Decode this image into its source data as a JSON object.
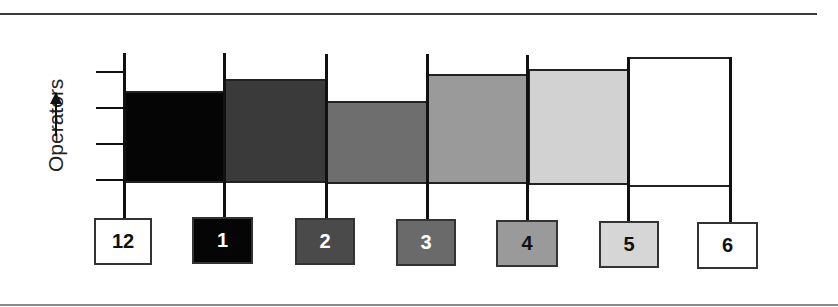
{
  "diagram": {
    "y_axis_label": "Operators",
    "y_axis_arrow": "arrow-up",
    "y_ticks": 4,
    "colors": {
      "line": "#111111",
      "box_border": "#333333"
    },
    "columns": [
      {
        "label": "12",
        "fill": "#ffffff",
        "text_color": "#111111",
        "bar_fill": "#050505",
        "bar_height_rel": 90
      },
      {
        "label": "1",
        "fill": "#050505",
        "text_color": "#ffffff",
        "bar_fill": "#3a3a3a",
        "bar_height_rel": 102
      },
      {
        "label": "2",
        "fill": "#4a4a4a",
        "text_color": "#ffffff",
        "bar_fill": "#6e6e6e",
        "bar_height_rel": 80
      },
      {
        "label": "3",
        "fill": "#6a6a6a",
        "text_color": "#ffffff",
        "bar_fill": "#9a9a9a",
        "bar_height_rel": 107
      },
      {
        "label": "4",
        "fill": "#9a9a9a",
        "text_color": "#111111",
        "bar_fill": "#d2d2d2",
        "bar_height_rel": 112
      },
      {
        "label": "5",
        "fill": "#d6d6d6",
        "text_color": "#111111",
        "bar_fill": "#ffffff",
        "bar_height_rel": 128
      },
      {
        "label": "6",
        "fill": "#ffffff",
        "text_color": "#111111"
      }
    ]
  }
}
